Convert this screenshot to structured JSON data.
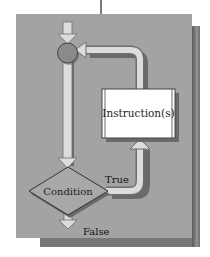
{
  "diagram": {
    "type": "flowchart-loop",
    "nodes": {
      "junction": {
        "shape": "circle",
        "color": "#8a8a8a"
      },
      "condition": {
        "shape": "diamond",
        "label": "Condition",
        "color": "#a8a8a8"
      },
      "instructions": {
        "shape": "rectangle",
        "label": "Instruction(s)",
        "color": "#ffffff"
      }
    },
    "edges": {
      "true_label": "True",
      "false_label": "False"
    },
    "colors": {
      "panel": "#a0a0a0",
      "panel_shadow": "#6e6e6e",
      "arrow_fill": "#d8d8d8",
      "arrow_stroke": "#707070",
      "line": "#222222"
    }
  }
}
